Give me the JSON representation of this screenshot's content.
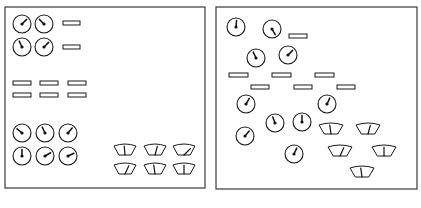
{
  "diagram": {
    "colors": {
      "line": "#1a1a1a",
      "frame": "#3a3a3a",
      "background": "#ffffff"
    },
    "panels": [
      {
        "id": "left-panel",
        "layout": "grouped",
        "frame": {
          "x": 5,
          "y": 7,
          "w": 200,
          "h": 181
        },
        "dial_gauges": [
          {
            "cx": 22,
            "cy": 24,
            "angle": 45
          },
          {
            "cx": 44,
            "cy": 24,
            "angle": -45
          },
          {
            "cx": 22,
            "cy": 47,
            "angle": -25
          },
          {
            "cx": 44,
            "cy": 47,
            "angle": 45
          },
          {
            "cx": 22,
            "cy": 133,
            "angle": -50
          },
          {
            "cx": 45,
            "cy": 133,
            "angle": -25
          },
          {
            "cx": 68,
            "cy": 133,
            "angle": 40
          },
          {
            "cx": 22,
            "cy": 156,
            "angle": 0
          },
          {
            "cx": 45,
            "cy": 156,
            "angle": 60
          },
          {
            "cx": 68,
            "cy": 156,
            "angle": 65
          }
        ],
        "indicator_lights": [
          {
            "x": 63,
            "y": 21,
            "w": 17,
            "h": 4
          },
          {
            "x": 63,
            "y": 45,
            "w": 17,
            "h": 4
          },
          {
            "x": 13,
            "y": 81,
            "w": 18,
            "h": 4
          },
          {
            "x": 40,
            "y": 81,
            "w": 18,
            "h": 4
          },
          {
            "x": 68,
            "y": 81,
            "w": 18,
            "h": 4
          },
          {
            "x": 13,
            "y": 93,
            "w": 18,
            "h": 4
          },
          {
            "x": 40,
            "y": 93,
            "w": 18,
            "h": 4
          },
          {
            "x": 68,
            "y": 93,
            "w": 18,
            "h": 4
          }
        ],
        "sector_meters": [
          {
            "x": 114,
            "y": 144,
            "w": 22,
            "h": 11,
            "angle": -5
          },
          {
            "x": 144,
            "y": 144,
            "w": 22,
            "h": 11,
            "angle": 15
          },
          {
            "x": 173,
            "y": 144,
            "w": 22,
            "h": 11,
            "angle": 45
          },
          {
            "x": 114,
            "y": 163,
            "w": 22,
            "h": 11,
            "angle": 25
          },
          {
            "x": 144,
            "y": 163,
            "w": 22,
            "h": 11,
            "angle": -8
          },
          {
            "x": 173,
            "y": 163,
            "w": 22,
            "h": 11,
            "angle": 0
          }
        ]
      },
      {
        "id": "right-panel",
        "layout": "scattered",
        "frame": {
          "x": 216,
          "y": 7,
          "w": 201,
          "h": 182
        },
        "dial_gauges": [
          {
            "cx": 236,
            "cy": 27,
            "angle": 5
          },
          {
            "cx": 272,
            "cy": 29,
            "angle": 150
          },
          {
            "cx": 256,
            "cy": 58,
            "angle": -25
          },
          {
            "cx": 288,
            "cy": 55,
            "angle": 45
          },
          {
            "cx": 246,
            "cy": 104,
            "angle": 30
          },
          {
            "cx": 327,
            "cy": 104,
            "angle": 25
          },
          {
            "cx": 275,
            "cy": 123,
            "angle": -20
          },
          {
            "cx": 302,
            "cy": 122,
            "angle": 0
          },
          {
            "cx": 245,
            "cy": 136,
            "angle": 40
          },
          {
            "cx": 294,
            "cy": 154,
            "angle": 25
          }
        ],
        "indicator_lights": [
          {
            "x": 289,
            "y": 34,
            "w": 18,
            "h": 4
          },
          {
            "x": 229,
            "y": 73,
            "w": 19,
            "h": 4
          },
          {
            "x": 272,
            "y": 73,
            "w": 19,
            "h": 4
          },
          {
            "x": 315,
            "y": 73,
            "w": 19,
            "h": 4
          },
          {
            "x": 251,
            "y": 85,
            "w": 18,
            "h": 4
          },
          {
            "x": 294,
            "y": 85,
            "w": 18,
            "h": 4
          },
          {
            "x": 337,
            "y": 85,
            "w": 18,
            "h": 4
          }
        ],
        "sector_meters": [
          {
            "x": 319,
            "y": 123,
            "w": 24,
            "h": 11,
            "angle": -8
          },
          {
            "x": 356,
            "y": 123,
            "w": 24,
            "h": 11,
            "angle": 15
          },
          {
            "x": 328,
            "y": 145,
            "w": 24,
            "h": 11,
            "angle": 25
          },
          {
            "x": 372,
            "y": 145,
            "w": 24,
            "h": 11,
            "angle": 0
          },
          {
            "x": 350,
            "y": 166,
            "w": 24,
            "h": 11,
            "angle": -8
          }
        ]
      }
    ]
  }
}
